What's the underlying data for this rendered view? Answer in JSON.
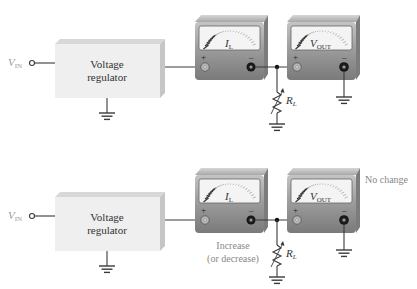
{
  "diagram": {
    "colors": {
      "wire": "#3a3a3a",
      "box_front": "#efefef",
      "box_top": "#d8d8d8",
      "box_side": "#c8c8c8",
      "meter_body": "#8a8a8a",
      "meter_body_light": "#b4b4b4",
      "meter_face": "#f4f4f4",
      "scale_dark": "#333333",
      "scale_light": "#bbbbbb",
      "faded_text": "#9a9a9a",
      "text": "#333333"
    },
    "circuits": [
      {
        "id": "top",
        "input_label": "V",
        "input_sub": "IN",
        "regulator_line1": "Voltage",
        "regulator_line2": "regulator",
        "ammeter_label": "I",
        "ammeter_sub": "L",
        "voltmeter_label": "V",
        "voltmeter_sub": "OUT",
        "plus": "+",
        "minus": "–",
        "resistor_label": "R",
        "resistor_sub": "L",
        "annotation_current": "",
        "annotation_current_2": "",
        "annotation_voltage": ""
      },
      {
        "id": "bottom",
        "input_label": "V",
        "input_sub": "IN",
        "regulator_line1": "Voltage",
        "regulator_line2": "regulator",
        "ammeter_label": "I",
        "ammeter_sub": "L",
        "voltmeter_label": "V",
        "voltmeter_sub": "OUT",
        "plus": "+",
        "minus": "–",
        "resistor_label": "R",
        "resistor_sub": "L",
        "annotation_current": "Increase",
        "annotation_current_2": "(or decrease)",
        "annotation_voltage": "No change"
      }
    ]
  }
}
